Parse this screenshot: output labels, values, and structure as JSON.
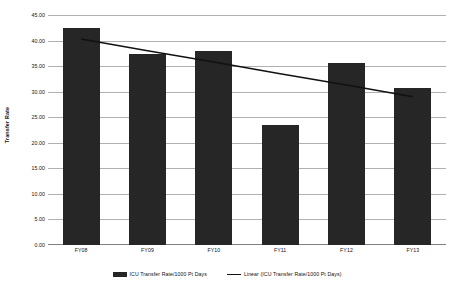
{
  "chart_data": {
    "type": "bar",
    "title": "",
    "subtitle": "",
    "xlabel": "",
    "ylabel": "Transfer Rate",
    "categories": [
      "FY08",
      "FY09",
      "FY10",
      "FY11",
      "FY12",
      "FY13"
    ],
    "series": [
      {
        "name": "ICU Transfer Rate/1000 Pt Days",
        "type": "bar",
        "color": "#262626",
        "values": [
          42.4,
          37.3,
          38.0,
          23.5,
          35.6,
          30.7
        ]
      },
      {
        "name": "Linear (ICU Transfer Rate/1000 Pt Days)",
        "type": "line",
        "color": "#111111",
        "values": [
          40.3,
          38.0,
          35.8,
          33.5,
          31.3,
          29.0
        ]
      }
    ],
    "ylim": [
      0,
      45
    ],
    "ytick_step": 5,
    "ytick_labels": [
      "0.00",
      "5.00",
      "10.00",
      "15.00",
      "20.00",
      "25.00",
      "30.00",
      "35.00",
      "40.00",
      "45.00"
    ],
    "ytick_values": [
      0,
      5,
      10,
      15,
      20,
      25,
      30,
      35,
      40,
      45
    ],
    "grid": true,
    "grid_color": "#b0b0b0",
    "legend_position": "bottom",
    "legend": [
      {
        "label": "ICU Transfer Rate/1000 Pt Days",
        "marker": "bar-swatch",
        "color": "#262626"
      },
      {
        "label": "Linear (ICU Transfer Rate/1000 Pt Days)",
        "marker": "line-swatch",
        "color": "#111111"
      }
    ],
    "background": "#ffffff"
  }
}
